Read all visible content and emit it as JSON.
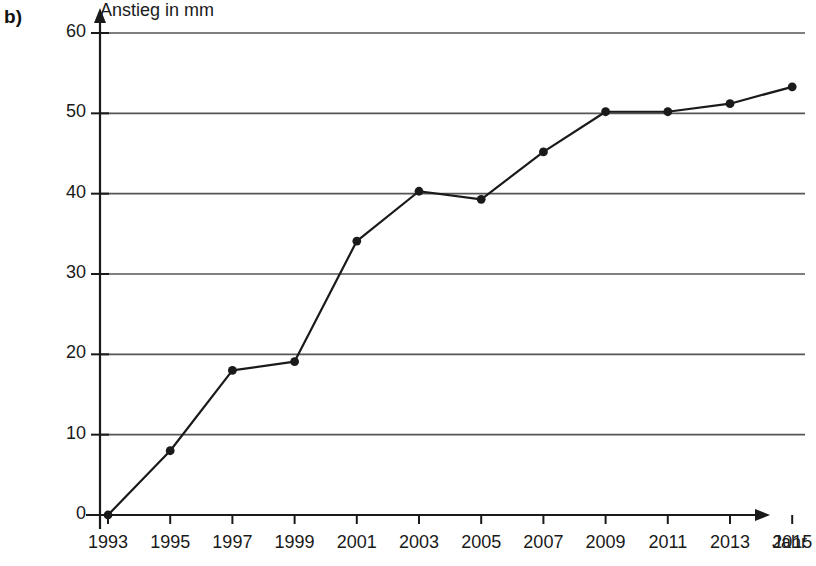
{
  "figure": {
    "part_label": "b)",
    "y_axis_title": "Anstieg in mm",
    "x_axis_title": "Jahr"
  },
  "chart_data": {
    "type": "line",
    "title": "",
    "subtitle": "",
    "xlabel": "Jahr",
    "ylabel": "Anstieg in mm",
    "categories": [
      "1993",
      "1995",
      "1997",
      "1999",
      "2001",
      "2003",
      "2005",
      "2007",
      "2009",
      "2011",
      "2013",
      "2015"
    ],
    "x": [
      1993,
      1995,
      1997,
      1999,
      2001,
      2003,
      2005,
      2007,
      2009,
      2011,
      2013,
      2015
    ],
    "values": [
      0,
      8,
      18,
      19.1,
      34.1,
      40.3,
      39.3,
      45.2,
      50.2,
      50.2,
      51.2,
      53.3
    ],
    "series": [
      {
        "name": "Anstieg in mm",
        "values": [
          0,
          8,
          18,
          19.1,
          34.1,
          40.3,
          39.3,
          45.2,
          50.2,
          50.2,
          51.2,
          53.3
        ]
      }
    ],
    "ylim": [
      0,
      60
    ],
    "ytick_labels": [
      "0",
      "10",
      "20",
      "30",
      "40",
      "50",
      "60"
    ],
    "yticks": [
      0,
      10,
      20,
      30,
      40,
      50,
      60
    ],
    "xtick_labels": [
      "1993",
      "1995",
      "1997",
      "1999",
      "2001",
      "2003",
      "2005",
      "2007",
      "2009",
      "2011",
      "2013",
      "2015"
    ],
    "grid": "horizontal",
    "legend": "none",
    "line_color": "#1a1a1a",
    "marker_color": "#1a1a1a",
    "grid_color": "#555555",
    "axis_color": "#1a1a1a",
    "marker": "circle"
  }
}
